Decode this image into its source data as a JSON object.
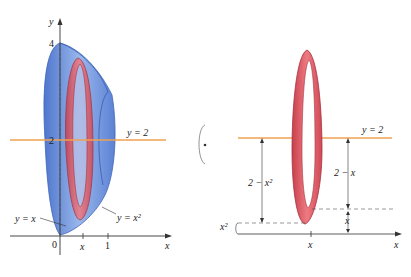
{
  "left_figure": {
    "y_axis_label": "y",
    "x_axis_label": "x",
    "tick_y4": "4",
    "tick_y2": "2",
    "tick_x0": "0",
    "tick_xx": "x",
    "tick_x1": "1",
    "line_label": "y = 2",
    "curve_label_linear": "y = x",
    "curve_label_parabola": "y = x²"
  },
  "rotation_icon": "rotation-arrow-icon",
  "right_figure": {
    "line_label": "y = 2",
    "outer_radius_label": "2 − x²",
    "inner_radius_label": "2 − x",
    "small_x_label": "x",
    "x2_label": "x²",
    "x_tick_label": "x",
    "x_axis_label": "x"
  },
  "colors": {
    "solid_blue": "#5b86d6",
    "ring_red": "#d9545e",
    "line_orange": "#f0a050",
    "axis": "#333333"
  }
}
